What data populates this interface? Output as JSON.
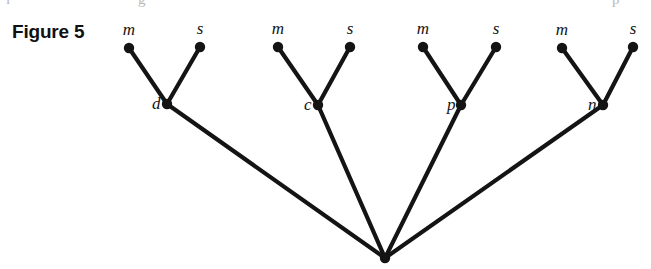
{
  "figure": {
    "label": "Figure 5",
    "background_color": "#ffffff",
    "ink_color": "#141414",
    "width": 651,
    "height": 269
  },
  "diagram": {
    "type": "tree",
    "root": {
      "id": "root",
      "x": 385,
      "y": 258,
      "label": ""
    },
    "internal_nodes": [
      {
        "id": "d",
        "label": "d",
        "x": 167,
        "y": 104,
        "label_x": 152,
        "label_y": 109
      },
      {
        "id": "c",
        "label": "c",
        "x": 318,
        "y": 105,
        "label_x": 304,
        "label_y": 110
      },
      {
        "id": "p",
        "label": "p",
        "x": 461,
        "y": 105,
        "label_x": 447,
        "label_y": 110
      },
      {
        "id": "n",
        "label": "n",
        "x": 603,
        "y": 105,
        "label_x": 588,
        "label_y": 110
      }
    ],
    "leaves": [
      {
        "id": "d-m",
        "label": "m",
        "x": 129,
        "y": 48,
        "label_x": 129,
        "label_y": 35,
        "parent": "d"
      },
      {
        "id": "d-s",
        "label": "s",
        "x": 200,
        "y": 47,
        "label_x": 200,
        "label_y": 34,
        "parent": "d"
      },
      {
        "id": "c-m",
        "label": "m",
        "x": 278,
        "y": 47,
        "label_x": 278,
        "label_y": 34,
        "parent": "c"
      },
      {
        "id": "c-s",
        "label": "s",
        "x": 350,
        "y": 47,
        "label_x": 350,
        "label_y": 34,
        "parent": "c"
      },
      {
        "id": "p-m",
        "label": "m",
        "x": 423,
        "y": 47,
        "label_x": 423,
        "label_y": 34,
        "parent": "p"
      },
      {
        "id": "p-s",
        "label": "s",
        "x": 496,
        "y": 47,
        "label_x": 496,
        "label_y": 34,
        "parent": "p"
      },
      {
        "id": "n-m",
        "label": "m",
        "x": 562,
        "y": 48,
        "label_x": 562,
        "label_y": 35,
        "parent": "n"
      },
      {
        "id": "n-s",
        "label": "s",
        "x": 633,
        "y": 47,
        "label_x": 633,
        "label_y": 34,
        "parent": "n"
      }
    ],
    "node_radius": 5.2,
    "edge_width": 4.2
  },
  "top_crop_artifacts": [
    {
      "glyph": "i",
      "x": 6
    },
    {
      "glyph": "g",
      "x": 138
    },
    {
      "glyph": "p",
      "x": 612
    }
  ]
}
